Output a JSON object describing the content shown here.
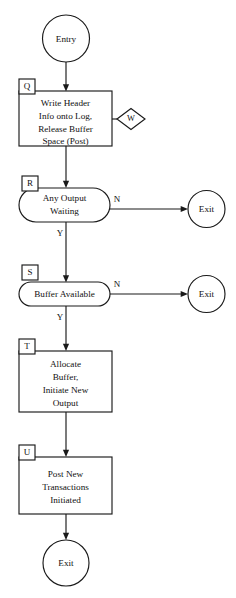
{
  "diagram": {
    "background_color": "#ffffff",
    "line_color": "#1a1a1a",
    "text_color": "#111111"
  },
  "terminators": {
    "entry": "Entry",
    "exit_r": "Exit",
    "exit_s": "Exit",
    "exit_final": "Exit"
  },
  "tags": {
    "q": "Q",
    "r": "R",
    "s": "S",
    "t": "T",
    "u": "U",
    "w": "W"
  },
  "nodes": {
    "q_process": {
      "tag": "Q",
      "type": "process",
      "lines": [
        "Write Header",
        "Info onto Log,",
        "Release Buffer",
        "Space (Post)"
      ]
    },
    "r_decision": {
      "tag": "R",
      "type": "decision",
      "lines": [
        "Any Output",
        "Waiting"
      ]
    },
    "s_decision": {
      "tag": "S",
      "type": "decision",
      "lines": [
        "Buffer Available"
      ]
    },
    "t_process": {
      "tag": "T",
      "type": "process",
      "lines": [
        "Allocate",
        "Buffer,",
        "Initiate New",
        "Output"
      ]
    },
    "u_process": {
      "tag": "U",
      "type": "process",
      "lines": [
        "Post New",
        "Transactions",
        "Initiated"
      ]
    },
    "w_connector": {
      "tag": "W",
      "type": "offpage-connector",
      "label": "W"
    }
  },
  "branch_labels": {
    "r_no": "N",
    "r_yes": "Y",
    "s_no": "N",
    "s_yes": "Y"
  }
}
